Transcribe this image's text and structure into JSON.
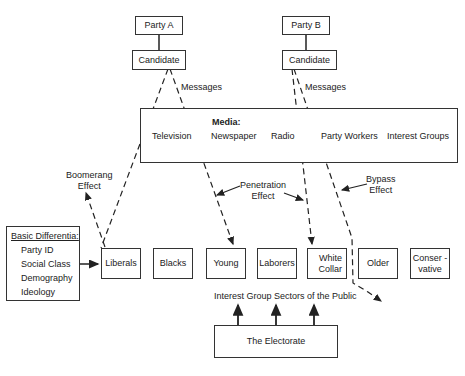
{
  "parties": [
    {
      "name": "Party A",
      "candidate": "Candidate",
      "messages": "Messages"
    },
    {
      "name": "Party B",
      "candidate": "Candidate",
      "messages": "Messages"
    }
  ],
  "media": {
    "title": "Media:",
    "items": [
      "Television",
      "Newspaper",
      "Radio",
      "Party Workers",
      "Interest Groups"
    ]
  },
  "effects": {
    "boomerang": [
      "Boomerang",
      "Effect"
    ],
    "penetration": [
      "Penetration",
      "Effect"
    ],
    "bypass": [
      "Bypass",
      "Effect"
    ]
  },
  "differentia": {
    "title": "Basic Differentia:",
    "items": [
      "Party ID",
      "Social Class",
      "Demography",
      "Ideology"
    ]
  },
  "sectors": [
    {
      "label": "Liberals"
    },
    {
      "label": "Blacks"
    },
    {
      "label": "Young"
    },
    {
      "label": "Laborers"
    },
    {
      "label": "White Collar",
      "lines": [
        "White",
        "Collar"
      ]
    },
    {
      "label": "Older"
    },
    {
      "label": "Conservative",
      "lines": [
        "Conser -",
        "vative"
      ]
    }
  ],
  "sectors_caption": "Interest Group Sectors of the Public",
  "electorate": "The Electorate"
}
